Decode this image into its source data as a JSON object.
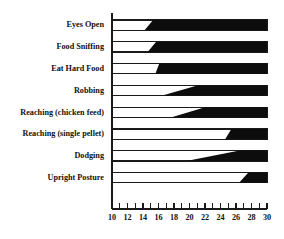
{
  "chart_data": {
    "type": "bar",
    "title": "",
    "subtitle": "",
    "xlabel": "",
    "ylabel": "",
    "orientation": "horizontal",
    "grid": false,
    "legend": null,
    "xlim": [
      10,
      30
    ],
    "xticks": [
      10,
      11,
      12,
      13,
      14,
      15,
      16,
      17,
      18,
      19,
      20,
      21,
      22,
      23,
      24,
      25,
      26,
      27,
      28,
      29,
      30
    ],
    "xtick_labels": [
      "10",
      "",
      "12",
      "",
      "14",
      "",
      "16",
      "",
      "18",
      "",
      "20",
      "",
      "22",
      "",
      "24",
      "",
      "26",
      "",
      "28",
      "",
      "30"
    ],
    "xtick_labeled_values": [
      10,
      12,
      14,
      16,
      18,
      20,
      22,
      24,
      26,
      28,
      30
    ],
    "categories": [
      "Eyes Open",
      "Food Sniffing",
      "Eat Hard Food",
      "Robbing",
      "Reaching (chicken feed)",
      "Reaching (single pellet)",
      "Dodging",
      "Upright Posture"
    ],
    "bars": [
      {
        "label": "Eyes Open",
        "bar_start": 10,
        "onset_start": 14.2,
        "onset_full": 15.3,
        "bar_end": 30,
        "filled_span": [
          14.2,
          30
        ]
      },
      {
        "label": "Food Sniffing",
        "bar_start": 10,
        "onset_start": 14.6,
        "onset_full": 15.7,
        "bar_end": 30,
        "filled_span": [
          14.6,
          30
        ]
      },
      {
        "label": "Eat Hard Food",
        "bar_start": 10,
        "onset_start": 15.6,
        "onset_full": 16.1,
        "bar_end": 30,
        "filled_span": [
          15.6,
          30
        ]
      },
      {
        "label": "Robbing",
        "bar_start": 10,
        "onset_start": 16.5,
        "onset_full": 21.0,
        "bar_end": 30,
        "filled_span": [
          16.5,
          30
        ]
      },
      {
        "label": "Reaching (chicken feed)",
        "bar_start": 10,
        "onset_start": 17.6,
        "onset_full": 22.0,
        "bar_end": 30,
        "filled_span": [
          17.6,
          30
        ]
      },
      {
        "label": "Reaching (single pellet)",
        "bar_start": 10,
        "onset_start": 24.6,
        "onset_full": 25.4,
        "bar_end": 30,
        "filled_span": [
          24.6,
          30
        ]
      },
      {
        "label": "Dodging",
        "bar_start": 10,
        "onset_start": 19.6,
        "onset_full": 26.3,
        "bar_end": 30,
        "filled_span": [
          19.6,
          30
        ]
      },
      {
        "label": "Upright Posture",
        "bar_start": 10,
        "onset_start": 26.4,
        "onset_full": 27.6,
        "bar_end": 30,
        "filled_span": [
          26.4,
          30
        ]
      }
    ],
    "colors": {
      "fill": "#0d0d0d",
      "outline": "#1a1a1a",
      "background": "#ffffff",
      "text": "#111111"
    }
  }
}
